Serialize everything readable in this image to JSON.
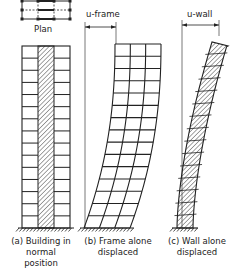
{
  "diagram": {
    "type": "structural-deformation-illustration",
    "panels": [
      {
        "id": "a",
        "caption_line1": "(a) Building in",
        "caption_line2": "normal",
        "caption_line3": "position",
        "top_label": "Plan",
        "floors": 15,
        "bays": 3
      },
      {
        "id": "b",
        "caption_line1": "(b) Frame alone",
        "caption_line2": "displaced",
        "dimension_label": "u-frame",
        "floors": 15,
        "bays": 3
      },
      {
        "id": "c",
        "caption_line1": "(c) Wall alone",
        "caption_line2": "displaced",
        "dimension_label": "u-wall",
        "floors": 15
      }
    ],
    "colors": {
      "line": "#222222",
      "hatch": "#333333",
      "background": "#ffffff"
    }
  }
}
